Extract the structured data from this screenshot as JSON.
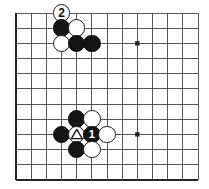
{
  "figure": {
    "kind": "go-board-diagram",
    "background_color": "#ffffff",
    "line_color": "#444444",
    "edge_color": "#222222",
    "black_color": "#151515",
    "white_color": "#ffffff"
  },
  "board": {
    "origin_x": 16,
    "origin_y": 13,
    "spacing": 15.17,
    "cols": 12,
    "rows": 11,
    "left_edge": true,
    "bottom_edge": true,
    "top_edge": false,
    "right_edge": false,
    "star_points": [
      {
        "col": 8,
        "row": 2
      },
      {
        "col": 8,
        "row": 8
      }
    ]
  },
  "stones": [
    {
      "id": "w-2",
      "color": "white",
      "col": 3,
      "row": 0,
      "label": "2",
      "marker": "none"
    },
    {
      "id": "b-a",
      "color": "black",
      "col": 3,
      "row": 1,
      "label": "",
      "marker": "none"
    },
    {
      "id": "w-b",
      "color": "white",
      "col": 4,
      "row": 1,
      "label": "",
      "marker": "none"
    },
    {
      "id": "w-c",
      "color": "white",
      "col": 3,
      "row": 2,
      "label": "",
      "marker": "none"
    },
    {
      "id": "b-d",
      "color": "black",
      "col": 4,
      "row": 2,
      "label": "",
      "marker": "none"
    },
    {
      "id": "b-e",
      "color": "black",
      "col": 5,
      "row": 2,
      "label": "",
      "marker": "none"
    },
    {
      "id": "b-f",
      "color": "black",
      "col": 4,
      "row": 7,
      "label": "",
      "marker": "none"
    },
    {
      "id": "w-g",
      "color": "white",
      "col": 5,
      "row": 7,
      "label": "",
      "marker": "none"
    },
    {
      "id": "b-h",
      "color": "black",
      "col": 3,
      "row": 8,
      "label": "",
      "marker": "none"
    },
    {
      "id": "w-tri",
      "color": "white",
      "col": 4,
      "row": 8,
      "label": "",
      "marker": "triangle"
    },
    {
      "id": "b-1",
      "color": "black",
      "col": 5,
      "row": 8,
      "label": "1",
      "marker": "none"
    },
    {
      "id": "w-i",
      "color": "white",
      "col": 6,
      "row": 8,
      "label": "",
      "marker": "none"
    },
    {
      "id": "b-j",
      "color": "black",
      "col": 4,
      "row": 9,
      "label": "",
      "marker": "none"
    },
    {
      "id": "w-k",
      "color": "white",
      "col": 5,
      "row": 9,
      "label": "",
      "marker": "none"
    }
  ],
  "move_labels": {
    "white_move_2": "2",
    "black_move_1": "1"
  },
  "markers": {
    "triangle_name": "triangle-marker"
  }
}
